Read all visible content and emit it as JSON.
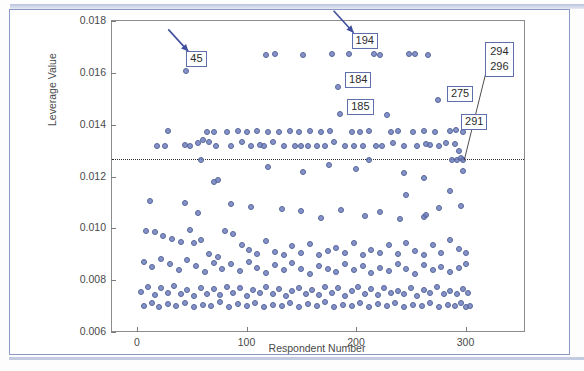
{
  "chart_data": {
    "type": "scatter",
    "title": "",
    "xlabel": "Respondent Number",
    "ylabel": "Leverage Value",
    "xlim": [
      -12,
      318
    ],
    "ylim": [
      0.006,
      0.018
    ],
    "xticks": [
      0,
      100,
      200,
      300
    ],
    "xtick_labels": [
      "0",
      "100",
      "200",
      "300"
    ],
    "yticks": [
      0.006,
      0.008,
      0.01,
      0.012,
      0.014,
      0.016,
      0.018
    ],
    "ytick_labels": [
      "0.006",
      "0.008",
      "0.010",
      "0.012",
      "0.014",
      "0.016",
      "0.018"
    ],
    "grid": false,
    "legend": null,
    "threshold_line": {
      "value": 0.01269,
      "style": "dotted",
      "color": "#2b2b2b",
      "orientation": "horizontal"
    },
    "marker": {
      "shape": "circle",
      "fill": "#6878ba",
      "edge": "#56659b",
      "opacity": 0.8,
      "size_px": 6
    },
    "annotations": [
      {
        "label": "45",
        "point_x": 45,
        "point_y": 0.01608,
        "kind": "arrow",
        "box_x": 45,
        "box_y": 0.01652
      },
      {
        "label": "194",
        "point_x": 194,
        "point_y": 0.01672,
        "kind": "arrow",
        "box_x": 196,
        "box_y": 0.01724
      },
      {
        "label": "184",
        "point_x": 184,
        "point_y": 0.01545,
        "kind": "box",
        "box_x": 190,
        "box_y": 0.01573
      },
      {
        "label": "185",
        "point_x": 185,
        "point_y": 0.0144,
        "kind": "box",
        "box_x": 192,
        "box_y": 0.0147
      },
      {
        "label": "275",
        "point_x": 275,
        "point_y": 0.01495,
        "kind": "box",
        "box_x": 283,
        "box_y": 0.0152
      },
      {
        "label": "291",
        "point_x": 291,
        "point_y": 0.01378,
        "kind": "box",
        "box_x": 296,
        "box_y": 0.0141
      },
      {
        "label": "294\n296",
        "label_lines": [
          "294",
          "296"
        ],
        "point_x": 297,
        "point_y": 0.0127,
        "kind": "leader",
        "box_x": 318,
        "box_y": 0.0169
      }
    ],
    "points": [
      [
        45,
        0.01608
      ],
      [
        194,
        0.01672
      ],
      [
        118,
        0.0167
      ],
      [
        126,
        0.01672
      ],
      [
        152,
        0.01668
      ],
      [
        178,
        0.01672
      ],
      [
        216,
        0.01672
      ],
      [
        222,
        0.0167
      ],
      [
        248,
        0.01674
      ],
      [
        254,
        0.01672
      ],
      [
        266,
        0.0167
      ],
      [
        184,
        0.01545
      ],
      [
        275,
        0.01495
      ],
      [
        185,
        0.0144
      ],
      [
        291,
        0.01378
      ],
      [
        28,
        0.01374
      ],
      [
        64,
        0.0137
      ],
      [
        70,
        0.01372
      ],
      [
        82,
        0.01373
      ],
      [
        92,
        0.01374
      ],
      [
        100,
        0.01372
      ],
      [
        110,
        0.01374
      ],
      [
        120,
        0.01372
      ],
      [
        130,
        0.01373
      ],
      [
        140,
        0.01374
      ],
      [
        148,
        0.01372
      ],
      [
        158,
        0.01374
      ],
      [
        168,
        0.01372
      ],
      [
        176,
        0.01374
      ],
      [
        196,
        0.01372
      ],
      [
        204,
        0.01373
      ],
      [
        212,
        0.01374
      ],
      [
        232,
        0.01372
      ],
      [
        238,
        0.01374
      ],
      [
        252,
        0.01372
      ],
      [
        262,
        0.01374
      ],
      [
        272,
        0.01372
      ],
      [
        286,
        0.01374
      ],
      [
        298,
        0.01372
      ],
      [
        18,
        0.01318
      ],
      [
        26,
        0.01318
      ],
      [
        44,
        0.0132
      ],
      [
        48,
        0.01318
      ],
      [
        56,
        0.0133
      ],
      [
        60,
        0.0134
      ],
      [
        66,
        0.01335
      ],
      [
        72,
        0.01318
      ],
      [
        86,
        0.01318
      ],
      [
        96,
        0.01332
      ],
      [
        104,
        0.01318
      ],
      [
        112,
        0.0132
      ],
      [
        116,
        0.01318
      ],
      [
        124,
        0.01335
      ],
      [
        134,
        0.01318
      ],
      [
        144,
        0.01318
      ],
      [
        150,
        0.01318
      ],
      [
        156,
        0.01318
      ],
      [
        164,
        0.01318
      ],
      [
        172,
        0.01318
      ],
      [
        180,
        0.01332
      ],
      [
        190,
        0.01318
      ],
      [
        198,
        0.01318
      ],
      [
        206,
        0.01318
      ],
      [
        218,
        0.01318
      ],
      [
        224,
        0.01318
      ],
      [
        234,
        0.0133
      ],
      [
        244,
        0.01318
      ],
      [
        256,
        0.01318
      ],
      [
        264,
        0.01325
      ],
      [
        268,
        0.0132
      ],
      [
        276,
        0.01318
      ],
      [
        282,
        0.0133
      ],
      [
        290,
        0.01325
      ],
      [
        294,
        0.013
      ],
      [
        58,
        0.01262
      ],
      [
        212,
        0.01262
      ],
      [
        288,
        0.01265
      ],
      [
        292,
        0.01262
      ],
      [
        296,
        0.0127
      ],
      [
        298,
        0.01262
      ],
      [
        70,
        0.0118
      ],
      [
        74,
        0.01188
      ],
      [
        152,
        0.01218
      ],
      [
        200,
        0.0123
      ],
      [
        246,
        0.01128
      ],
      [
        262,
        0.01195
      ],
      [
        286,
        0.01145
      ],
      [
        298,
        0.0122
      ],
      [
        12,
        0.01105
      ],
      [
        44,
        0.01098
      ],
      [
        56,
        0.0106
      ],
      [
        86,
        0.01095
      ],
      [
        104,
        0.01082
      ],
      [
        132,
        0.01075
      ],
      [
        150,
        0.01065
      ],
      [
        168,
        0.0104
      ],
      [
        186,
        0.0107
      ],
      [
        208,
        0.01048
      ],
      [
        222,
        0.01062
      ],
      [
        240,
        0.01035
      ],
      [
        262,
        0.01045
      ],
      [
        276,
        0.0108
      ],
      [
        296,
        0.01088
      ],
      [
        8,
        0.0099
      ],
      [
        16,
        0.00985
      ],
      [
        24,
        0.0097
      ],
      [
        32,
        0.00958
      ],
      [
        40,
        0.00948
      ],
      [
        48,
        0.00992
      ],
      [
        52,
        0.00942
      ],
      [
        58,
        0.00955
      ],
      [
        66,
        0.009
      ],
      [
        74,
        0.0089
      ],
      [
        80,
        0.0099
      ],
      [
        88,
        0.0098
      ],
      [
        96,
        0.00935
      ],
      [
        102,
        0.00918
      ],
      [
        110,
        0.00902
      ],
      [
        118,
        0.0095
      ],
      [
        126,
        0.0091
      ],
      [
        134,
        0.00896
      ],
      [
        142,
        0.00932
      ],
      [
        150,
        0.00905
      ],
      [
        158,
        0.0094
      ],
      [
        166,
        0.00898
      ],
      [
        174,
        0.00912
      ],
      [
        182,
        0.00925
      ],
      [
        190,
        0.00905
      ],
      [
        198,
        0.00942
      ],
      [
        206,
        0.00898
      ],
      [
        214,
        0.00918
      ],
      [
        222,
        0.00905
      ],
      [
        230,
        0.00935
      ],
      [
        238,
        0.009
      ],
      [
        246,
        0.00945
      ],
      [
        254,
        0.00912
      ],
      [
        262,
        0.00898
      ],
      [
        270,
        0.00935
      ],
      [
        278,
        0.00905
      ],
      [
        286,
        0.00955
      ],
      [
        294,
        0.00922
      ],
      [
        300,
        0.00905
      ],
      [
        6,
        0.0087
      ],
      [
        14,
        0.00852
      ],
      [
        22,
        0.00882
      ],
      [
        30,
        0.00862
      ],
      [
        38,
        0.0084
      ],
      [
        46,
        0.00878
      ],
      [
        54,
        0.00855
      ],
      [
        62,
        0.00832
      ],
      [
        70,
        0.00868
      ],
      [
        78,
        0.00845
      ],
      [
        86,
        0.00862
      ],
      [
        94,
        0.00835
      ],
      [
        102,
        0.00872
      ],
      [
        110,
        0.00848
      ],
      [
        118,
        0.00828
      ],
      [
        126,
        0.00858
      ],
      [
        134,
        0.00838
      ],
      [
        142,
        0.00868
      ],
      [
        150,
        0.00842
      ],
      [
        158,
        0.00822
      ],
      [
        166,
        0.00855
      ],
      [
        174,
        0.00845
      ],
      [
        182,
        0.0083
      ],
      [
        190,
        0.00862
      ],
      [
        198,
        0.00838
      ],
      [
        206,
        0.00855
      ],
      [
        214,
        0.00828
      ],
      [
        222,
        0.00848
      ],
      [
        230,
        0.00835
      ],
      [
        238,
        0.00862
      ],
      [
        246,
        0.00842
      ],
      [
        254,
        0.00822
      ],
      [
        262,
        0.00858
      ],
      [
        270,
        0.00838
      ],
      [
        278,
        0.00852
      ],
      [
        286,
        0.0083
      ],
      [
        294,
        0.00848
      ],
      [
        300,
        0.00862
      ],
      [
        4,
        0.00755
      ],
      [
        10,
        0.00772
      ],
      [
        16,
        0.00742
      ],
      [
        22,
        0.00768
      ],
      [
        28,
        0.00752
      ],
      [
        34,
        0.00778
      ],
      [
        40,
        0.00745
      ],
      [
        46,
        0.00762
      ],
      [
        52,
        0.00738
      ],
      [
        58,
        0.0077
      ],
      [
        64,
        0.00748
      ],
      [
        70,
        0.00765
      ],
      [
        76,
        0.00742
      ],
      [
        82,
        0.00772
      ],
      [
        88,
        0.0075
      ],
      [
        94,
        0.00768
      ],
      [
        100,
        0.0074
      ],
      [
        106,
        0.00762
      ],
      [
        112,
        0.00752
      ],
      [
        118,
        0.00775
      ],
      [
        124,
        0.00745
      ],
      [
        130,
        0.00765
      ],
      [
        136,
        0.00738
      ],
      [
        142,
        0.00758
      ],
      [
        148,
        0.0077
      ],
      [
        154,
        0.00748
      ],
      [
        160,
        0.00762
      ],
      [
        166,
        0.00742
      ],
      [
        172,
        0.00772
      ],
      [
        178,
        0.00752
      ],
      [
        184,
        0.00768
      ],
      [
        190,
        0.0074
      ],
      [
        196,
        0.00758
      ],
      [
        202,
        0.00772
      ],
      [
        208,
        0.00748
      ],
      [
        214,
        0.00765
      ],
      [
        220,
        0.00742
      ],
      [
        226,
        0.0077
      ],
      [
        232,
        0.00752
      ],
      [
        238,
        0.0076
      ],
      [
        244,
        0.00745
      ],
      [
        250,
        0.00768
      ],
      [
        256,
        0.00738
      ],
      [
        262,
        0.00762
      ],
      [
        268,
        0.00752
      ],
      [
        274,
        0.00772
      ],
      [
        280,
        0.00745
      ],
      [
        286,
        0.0076
      ],
      [
        292,
        0.00748
      ],
      [
        298,
        0.00765
      ],
      [
        302,
        0.00752
      ],
      [
        6,
        0.007
      ],
      [
        14,
        0.00712
      ],
      [
        20,
        0.00698
      ],
      [
        28,
        0.00708
      ],
      [
        36,
        0.007
      ],
      [
        44,
        0.00712
      ],
      [
        52,
        0.00698
      ],
      [
        60,
        0.00705
      ],
      [
        68,
        0.007
      ],
      [
        76,
        0.00715
      ],
      [
        84,
        0.00698
      ],
      [
        92,
        0.00708
      ],
      [
        100,
        0.007
      ],
      [
        108,
        0.00712
      ],
      [
        116,
        0.00698
      ],
      [
        124,
        0.00705
      ],
      [
        132,
        0.007
      ],
      [
        140,
        0.00712
      ],
      [
        148,
        0.00698
      ],
      [
        156,
        0.00708
      ],
      [
        164,
        0.007
      ],
      [
        172,
        0.00714
      ],
      [
        180,
        0.00698
      ],
      [
        188,
        0.00706
      ],
      [
        196,
        0.007
      ],
      [
        204,
        0.00712
      ],
      [
        212,
        0.00698
      ],
      [
        220,
        0.00708
      ],
      [
        228,
        0.007
      ],
      [
        236,
        0.00712
      ],
      [
        244,
        0.00698
      ],
      [
        252,
        0.00705
      ],
      [
        260,
        0.007
      ],
      [
        268,
        0.00712
      ],
      [
        276,
        0.00698
      ],
      [
        284,
        0.00706
      ],
      [
        290,
        0.007
      ],
      [
        296,
        0.0071
      ],
      [
        300,
        0.00698
      ],
      [
        304,
        0.00702
      ],
      [
        228,
        0.01438
      ],
      [
        264,
        0.01052
      ],
      [
        244,
        0.01215
      ],
      [
        120,
        0.01238
      ],
      [
        175,
        0.01245
      ]
    ]
  },
  "axes": {
    "ylabel_text": "Leverage Value",
    "xlabel_text": "Respondent Number"
  }
}
